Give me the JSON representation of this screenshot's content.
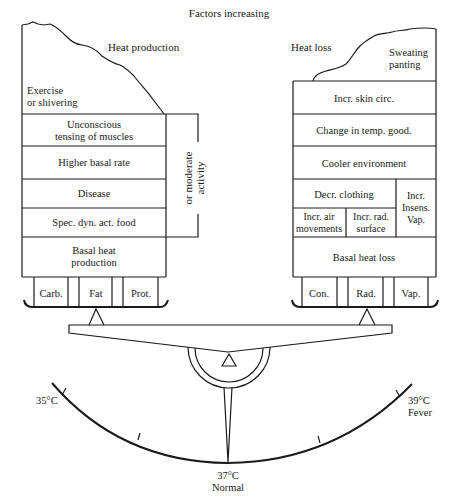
{
  "title": "Factors increasing",
  "left_column": {
    "heading": "Heat production",
    "top_label": [
      "Exercise",
      "or shivering"
    ],
    "rows": [
      [
        "Unconscious",
        "tensing of muscles"
      ],
      [
        "Higher basal rate"
      ],
      [
        "Disease"
      ],
      [
        "Spec. dyn. act. food"
      ],
      [
        "Basal heat",
        "production"
      ]
    ],
    "bracket_label": [
      "or moderate",
      "activity"
    ],
    "tray_items": [
      "Carb.",
      "Fat",
      "Prot."
    ]
  },
  "right_column": {
    "heading": "Heat loss",
    "top_label": [
      "Sweating",
      "panting"
    ],
    "rows": {
      "skin": "Incr. skin circ.",
      "temp": "Change in temp. good.",
      "cooler": "Cooler environment",
      "clothing": "Decr. clothing",
      "air": [
        "Incr. air",
        "movements"
      ],
      "rad": [
        "Incr. rad.",
        "surface"
      ],
      "insens": [
        "Incr.",
        "Insens.",
        "Vap."
      ],
      "basal": "Basal heat loss"
    },
    "tray_items": [
      "Con.",
      "Rad.",
      "Vap."
    ]
  },
  "scale": {
    "low": "35°C",
    "normal": [
      "37°C",
      "Normal"
    ],
    "high": [
      "39°C",
      "Fever"
    ]
  }
}
